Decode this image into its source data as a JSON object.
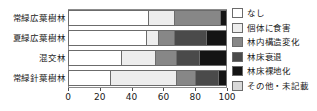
{
  "chart_data": {
    "type": "bar",
    "orientation": "horizontal",
    "stacked": true,
    "title": "",
    "xlabel": "",
    "ylabel": "",
    "xlim": [
      0,
      100
    ],
    "xticks": [
      0,
      20,
      40,
      60,
      80,
      100
    ],
    "grid": false,
    "legend_position": "right",
    "categories": [
      "常緑広葉樹林",
      "夏緑広葉樹林",
      "混交林",
      "常緑針葉樹林"
    ],
    "series": [
      {
        "name": "なし",
        "color": "#ffffff",
        "values": [
          50,
          49,
          33,
          26
        ]
      },
      {
        "name": "個体に食害",
        "color": "#ededed",
        "values": [
          17,
          8,
          22,
          42
        ]
      },
      {
        "name": "林内構造変化",
        "color": "#878787",
        "values": [
          29,
          10,
          13,
          12
        ]
      },
      {
        "name": "林床衰退",
        "color": "#4a4a4a",
        "values": [
          0,
          20,
          15,
          15
        ]
      },
      {
        "name": "林床裸地化",
        "color": "#141414",
        "values": [
          4,
          13,
          17,
          5
        ]
      },
      {
        "name": "その他・未記載",
        "color": "#d9d9d9",
        "values": [
          0,
          0,
          0,
          0
        ]
      }
    ],
    "xticklabels": [
      "0",
      "20",
      "40",
      "60",
      "80",
      "100"
    ]
  }
}
